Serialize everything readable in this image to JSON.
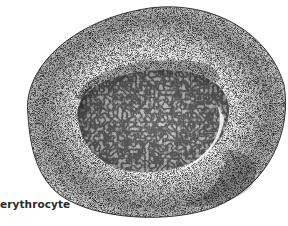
{
  "figure": {
    "subject": "erythrocyte",
    "style": "stippled pen illustration",
    "label": "erythrocyte",
    "colors": {
      "background": "#ffffff",
      "ink": "#1a1a1a",
      "label": "#2a2a2a"
    }
  }
}
